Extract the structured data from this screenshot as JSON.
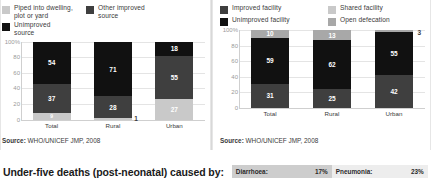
{
  "charts": {
    "water": {
      "legend": [
        {
          "label": "Piped into dwelling, plot or yard",
          "color": "#c9c9c9"
        },
        {
          "label": "Other improved source",
          "color": "#3f3f3f"
        },
        {
          "label": "Unimproved source",
          "color": "#111111"
        }
      ],
      "source": "Source:",
      "source_text": "WHO/UNICEF JMP, 2008"
    },
    "sanitation": {
      "legend": [
        {
          "label": "Improved facility",
          "color": "#3f3f3f"
        },
        {
          "label": "Shared facility",
          "color": "#c9c9c9"
        },
        {
          "label": "Unimproved facility",
          "color": "#111111"
        },
        {
          "label": "Open defecation",
          "color": "#a8a8a8"
        }
      ],
      "source": "Source:",
      "source_text": "WHO/UNICEF JMP, 2008"
    }
  },
  "chart_data": [
    {
      "type": "bar",
      "id": "drinking-water-coverage",
      "stacked": true,
      "title": "",
      "xlabel": "",
      "ylabel": "",
      "ylim": [
        0,
        100
      ],
      "yticks": [
        "100%",
        "80",
        "60",
        "40",
        "20",
        "0"
      ],
      "grid": true,
      "legend_position": "top",
      "categories": [
        "Total",
        "Rural",
        "Urban"
      ],
      "series": [
        {
          "name": "Piped into dwelling, plot or yard",
          "color": "#c9c9c9",
          "values": [
            9,
            1,
            27
          ]
        },
        {
          "name": "Other improved source",
          "color": "#3f3f3f",
          "values": [
            37,
            28,
            55
          ]
        },
        {
          "name": "Unimproved source",
          "color": "#111111",
          "values": [
            54,
            71,
            18
          ]
        }
      ],
      "source": "Source: WHO/UNICEF JMP, 2008"
    },
    {
      "type": "bar",
      "id": "sanitation-coverage",
      "stacked": true,
      "title": "",
      "xlabel": "",
      "ylabel": "",
      "ylim": [
        0,
        100
      ],
      "yticks": [
        "100%",
        "80",
        "60",
        "40",
        "20",
        "0"
      ],
      "grid": true,
      "legend_position": "top",
      "categories": [
        "Total",
        "Rural",
        "Urban"
      ],
      "series": [
        {
          "name": "Improved facility",
          "color": "#3f3f3f",
          "values": [
            31,
            25,
            42
          ]
        },
        {
          "name": "Unimproved facility",
          "color": "#111111",
          "values": [
            59,
            62,
            55
          ]
        },
        {
          "name": "Shared facility",
          "color": "#a8a8a8",
          "values": [
            10,
            13,
            3
          ]
        }
      ],
      "source": "Source: WHO/UNICEF JMP, 2008"
    }
  ],
  "bars": {
    "water": {
      "Total": [
        {
          "v": "54",
          "h": 54,
          "c": "#111111",
          "pos": "in"
        },
        {
          "v": "37",
          "h": 37,
          "c": "#3f3f3f",
          "pos": "in"
        },
        {
          "v": "9",
          "h": 9,
          "c": "#c9c9c9",
          "pos": "in",
          "tiny": true
        }
      ],
      "Rural": [
        {
          "v": "71",
          "h": 71,
          "c": "#111111",
          "pos": "in"
        },
        {
          "v": "28",
          "h": 28,
          "c": "#3f3f3f",
          "pos": "in"
        },
        {
          "v": "1",
          "h": 1,
          "c": "#c9c9c9",
          "pos": "out-below"
        }
      ],
      "Urban": [
        {
          "v": "18",
          "h": 18,
          "c": "#111111",
          "pos": "in"
        },
        {
          "v": "55",
          "h": 55,
          "c": "#3f3f3f",
          "pos": "in"
        },
        {
          "v": "27",
          "h": 27,
          "c": "#c9c9c9",
          "pos": "in"
        }
      ]
    },
    "sanitation": {
      "Total": [
        {
          "v": "10",
          "h": 10,
          "c": "#a8a8a8",
          "pos": "in"
        },
        {
          "v": "59",
          "h": 59,
          "c": "#111111",
          "pos": "in"
        },
        {
          "v": "31",
          "h": 31,
          "c": "#3f3f3f",
          "pos": "in"
        }
      ],
      "Rural": [
        {
          "v": "13",
          "h": 13,
          "c": "#a8a8a8",
          "pos": "in"
        },
        {
          "v": "62",
          "h": 62,
          "c": "#111111",
          "pos": "in"
        },
        {
          "v": "25",
          "h": 25,
          "c": "#3f3f3f",
          "pos": "in"
        }
      ],
      "Urban": [
        {
          "v": "3",
          "h": 3,
          "c": "#a8a8a8",
          "pos": "out-top"
        },
        {
          "v": "55",
          "h": 55,
          "c": "#111111",
          "pos": "in"
        },
        {
          "v": "42",
          "h": 42,
          "c": "#3f3f3f",
          "pos": "in"
        }
      ]
    }
  },
  "bottom": {
    "title": "Under-five deaths (post-neonatal) caused by:",
    "stats": [
      {
        "key": "Diarrhoea:",
        "value": "17%"
      },
      {
        "key": "Pneumonia:",
        "value": "23%"
      }
    ]
  }
}
